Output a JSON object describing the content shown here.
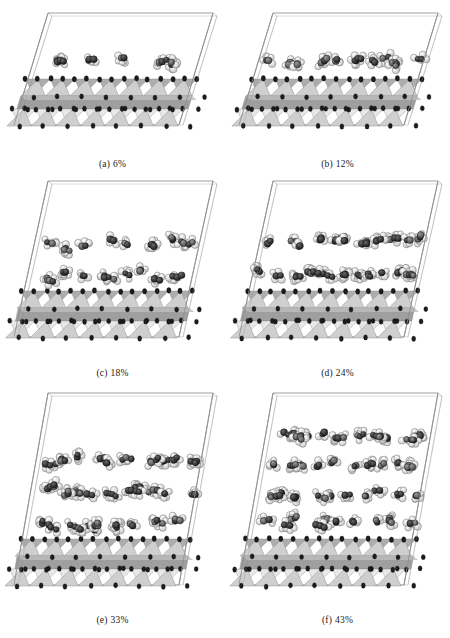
{
  "figure": {
    "running_head": "",
    "type": "molecular-dynamics-snapshot-grid",
    "columns": 2,
    "rows": 3,
    "panel_count": 6
  },
  "legend": {
    "atom_white": "hydrogen",
    "atom_dark": "carbon",
    "substrate": "clay mineral layer",
    "box": "periodic simulation cell"
  },
  "colors": {
    "box_line": "#8f8f8f",
    "atom_light": "#fdfdfd",
    "atom_light_edge": "#6e6e6e",
    "atom_dark": "#2b2b2b",
    "atom_dark_edge": "#141414",
    "atom_mid": "#5c5c5c",
    "tetra_front": "#cfcfcf",
    "tetra_back": "#a9a9a9",
    "tetra_edge": "#8a8a8a",
    "octa_slab": "#9a9a9a",
    "octa_slab_light": "#bdbdbd",
    "substrate_node": "#1c1c1c",
    "caption_text": "#1a1a1a"
  },
  "panels": [
    {
      "id": "a",
      "index_label": "(a)",
      "coverage_label": "6%",
      "coverage_value": 6,
      "arrangement": "sparse monolayer",
      "molecule_rows": 1,
      "density": 0.1
    },
    {
      "id": "b",
      "index_label": "(b)",
      "coverage_label": "12%",
      "coverage_value": 12,
      "arrangement": "dense monolayer",
      "molecule_rows": 1,
      "density": 0.22
    },
    {
      "id": "c",
      "index_label": "(c)",
      "coverage_label": "18%",
      "coverage_value": 18,
      "arrangement": "bilayer",
      "molecule_rows": 2,
      "density": 0.34
    },
    {
      "id": "d",
      "index_label": "(d)",
      "coverage_label": "24%",
      "coverage_value": 24,
      "arrangement": "thick bilayer",
      "molecule_rows": 2,
      "density": 0.46
    },
    {
      "id": "e",
      "index_label": "(e)",
      "coverage_label": "33%",
      "coverage_value": 33,
      "arrangement": "multilayer film",
      "molecule_rows": 3,
      "density": 0.64
    },
    {
      "id": "f",
      "index_label": "(f)",
      "coverage_label": "43%",
      "coverage_value": 43,
      "arrangement": "thick multilayer film",
      "molecule_rows": 4,
      "density": 0.82
    }
  ]
}
